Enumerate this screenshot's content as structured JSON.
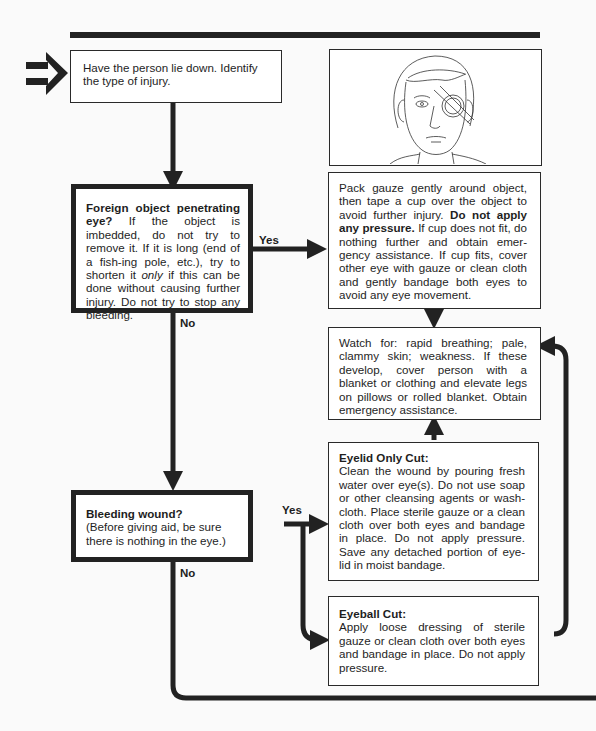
{
  "flowchart": {
    "start": {
      "text": "Have the person lie down. Identify the type of injury."
    },
    "illustration": {
      "description": "Line drawing of a man's face with a cup taped over his left eye"
    },
    "decision_foreign_object": {
      "heading": "Foreign object penetrating eye?",
      "text_part1": " If the object is imbedded, do not try to remove it. If it is long (end of a fish-ing pole, etc.), try to shorten it ",
      "text_italic": "only",
      "text_part2": " if this can be done without causing further injury. Do not try to stop any bleeding."
    },
    "action_foreign_object": {
      "text_part1": "Pack gauze gently around object, then tape a cup over the object to avoid further injury. ",
      "text_bold": "Do not apply any pressure.",
      "text_part2": " If cup does not fit, do nothing further and obtain emer-gency assistance. If cup fits, cover other eye with gauze or clean cloth and gently bandage both eyes to avoid any eye movement."
    },
    "watch_for": {
      "text": "Watch for: rapid breathing; pale, clammy skin; weakness. If these develop, cover person with a blanket or clothing and elevate legs on pillows or rolled blanket. Obtain emergency assistance."
    },
    "decision_bleeding": {
      "heading": "Bleeding wound?",
      "text": "(Before giving aid, be sure there is nothing in the eye.)"
    },
    "eyelid_cut": {
      "heading": "Eyelid Only Cut:",
      "text": "Clean the wound by pouring fresh water over eye(s). Do not use soap or other cleansing agents or wash-cloth. Place sterile gauze or a clean cloth over both eyes and bandage in place. Do not apply pressure. Save any detached portion of eye-lid in moist bandage."
    },
    "eyeball_cut": {
      "heading": "Eyeball Cut:",
      "text": "Apply loose dressing of sterile gauze or clean cloth over both eyes and bandage in place. Do not apply pressure."
    },
    "labels": {
      "yes_1": "Yes",
      "no_1": "No",
      "yes_2": "Yes",
      "no_2": "No"
    }
  },
  "colors": {
    "ink": "#222222",
    "paper": "#ffffff",
    "background": "#fafafa"
  }
}
